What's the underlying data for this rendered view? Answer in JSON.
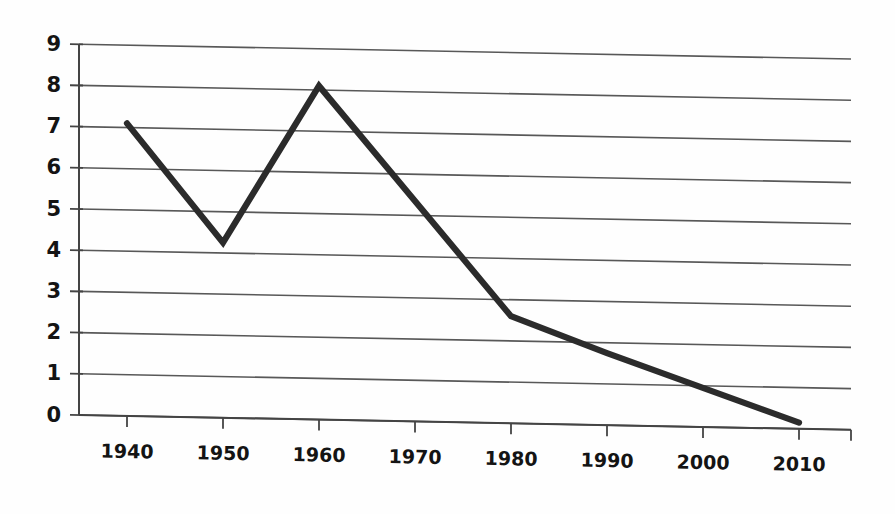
{
  "chart_data": {
    "type": "line",
    "title": "",
    "subtitle": "",
    "xlabel": "",
    "ylabel": "",
    "categories": [
      "1940",
      "1950",
      "1960",
      "1970",
      "1980",
      "1990",
      "2000",
      "2010"
    ],
    "x": [
      1940,
      1950,
      1960,
      1970,
      1980,
      1990,
      2000,
      2010
    ],
    "values": [
      7.1,
      4.25,
      8.1,
      5.3,
      2.6,
      1.75,
      0.75,
      0.15
    ],
    "series": [
      {
        "name": "series-1",
        "values": [
          7.1,
          4.25,
          8.1,
          5.3,
          2.6,
          1.75,
          0.75,
          0.15
        ],
        "color": "#2b2b2b"
      }
    ],
    "vertices": [
      {
        "x": 1940,
        "y": 7.1
      },
      {
        "x": 1950,
        "y": 4.25
      },
      {
        "x": 1960,
        "y": 8.1
      },
      {
        "x": 1980,
        "y": 2.6
      },
      {
        "x": 1990,
        "y": 1.75
      },
      {
        "x": 2010,
        "y": 0.15
      }
    ],
    "ylim": [
      0,
      9
    ],
    "xlim": [
      1935,
      2015
    ],
    "ytick_labels": [
      "0",
      "1",
      "2",
      "3",
      "4",
      "5",
      "6",
      "7",
      "8",
      "9"
    ],
    "ytick_values": [
      0,
      1,
      2,
      3,
      4,
      5,
      6,
      7,
      8,
      9
    ],
    "xtick_labels": [
      "1940",
      "1950",
      "1960",
      "1970",
      "1980",
      "1990",
      "2000",
      "2010"
    ],
    "grid": "horizontal",
    "legend": "none",
    "legend_position": "none",
    "annotations": [],
    "line_color": "#2b2b2b",
    "grid_color": "#585858",
    "axis_color": "#444444",
    "background_color": "#fefefe"
  },
  "geometry": {
    "plot_left": 79,
    "plot_right": 851,
    "plot_top": 44,
    "plot_bottom": 415,
    "skew_degrees": 1.1,
    "x_tick_pixels": [
      127,
      223,
      319,
      415,
      511,
      607,
      703,
      799
    ],
    "y_pixel_zero": 415,
    "y_pixel_per_unit": 41.2
  }
}
